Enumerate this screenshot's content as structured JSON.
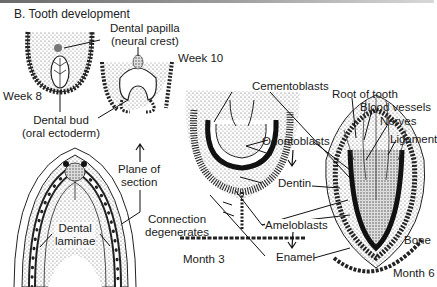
{
  "figure": {
    "title": "B. Tooth development",
    "labels": {
      "dental_papilla_line1": "Dental papilla",
      "dental_papilla_line2": "(neural crest)",
      "week8": "Week 8",
      "week10": "Week 10",
      "dental_bud_line1": "Dental bud",
      "dental_bud_line2": "(oral ectoderm)",
      "plane_line1": "Plane of",
      "plane_line2": "section",
      "dental_laminae_line1": "Dental",
      "dental_laminae_line2": "laminae",
      "connection_line1": "Connection",
      "connection_line2": "degenerates",
      "month3": "Month 3",
      "cementoblasts": "Cementoblasts",
      "odontoblasts": "Odontoblasts",
      "dentin": "Dentin",
      "ameloblasts": "Ameloblasts",
      "enamel": "Enamel",
      "root_of_tooth": "Root of tooth",
      "blood_vessels": "Blood vessels",
      "nerves": "Nerves",
      "ligament": "Ligament",
      "bone": "Bone",
      "month6": "Month 6"
    }
  }
}
